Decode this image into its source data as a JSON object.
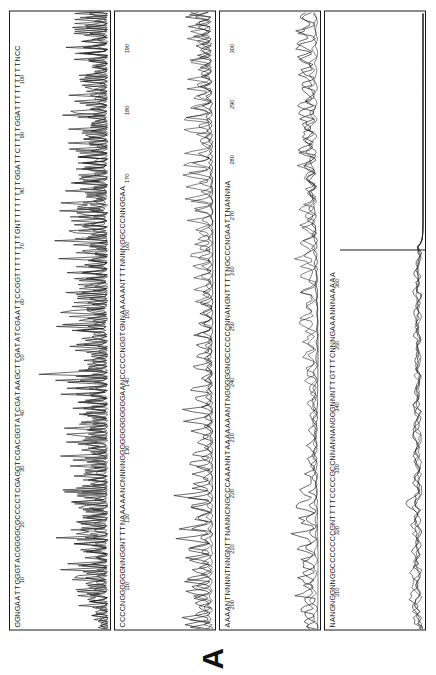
{
  "figure": {
    "panel_label": "A",
    "type": "dna-sequencing-chromatogram",
    "orientation": "rotated-90-ccw",
    "lane_count": 4,
    "ink_color": "#1b1b1b",
    "background_color": "#ffffff"
  },
  "lanes": [
    {
      "id": "lane-1",
      "name": "chromatogram-lane-1",
      "basecalls": "GGNGAATTGGGTACGGGGCGCCCCTCGAGGTCGACGGTATCGATAAGCTTGATATCGAATTCCGGTTTTTTTTGNTTTTTTTTGGATTCTTTTGGATTTTTTTTTNCC",
      "tick_labels": [
        "10",
        "20",
        "30",
        "40",
        "50",
        "60",
        "70",
        "80",
        "90",
        "100"
      ],
      "tick_positions_pct": [
        8.0,
        17.0,
        26.0,
        35.0,
        44.0,
        53.0,
        62.0,
        71.0,
        80.0,
        89.0
      ],
      "signal_quality": "high",
      "description": "sharp well-resolved peaks, tall square-topped early peaks"
    },
    {
      "id": "lane-2",
      "name": "chromatogram-lane-2",
      "basecalls": "CCCCNGGGGGGNNGGNTTTNAAAAANCNNNNGGGGGGGGGGGGAANCCCCCNGGTGNNAAAAANTTTNNNNGGCCCNNGGAA",
      "tick_labels": [
        "110",
        "120",
        "130",
        "140",
        "150",
        "160",
        "170",
        "180",
        "190"
      ],
      "tick_positions_pct": [
        7.0,
        18.0,
        29.0,
        40.0,
        51.0,
        62.0,
        73.0,
        84.0,
        94.0
      ],
      "signal_quality": "medium",
      "description": "broader overlapping peaks with rising baseline"
    },
    {
      "id": "lane-3",
      "name": "chromatogram-lane-3",
      "basecalls": "AAAANTNNNNTNNGNTTNANNCNGCCCAAANNTAAAAAAANTNGGGGGNGCCCCCCNNANGNTTTTNGCCCNGAATTNANNNA",
      "tick_labels": [
        "200",
        "210",
        "220",
        "230",
        "240",
        "250",
        "260",
        "270",
        "280",
        "290",
        "300"
      ],
      "tick_positions_pct": [
        4.0,
        13.0,
        22.0,
        31.0,
        40.0,
        49.0,
        58.0,
        67.0,
        76.0,
        85.0,
        94.0
      ],
      "signal_quality": "low",
      "description": "noisy poorly-resolved peaks, many N calls"
    },
    {
      "id": "lane-4",
      "name": "chromatogram-lane-4",
      "basecalls": "NANGNGGNNGGCCCCCCCGNTTTTCCCCGCCNNANNANGGGNNNTTGTTTCNNNGAAANNNAAAAA",
      "tick_labels": [
        "310",
        "320",
        "330",
        "340",
        "350",
        "360"
      ],
      "tick_positions_pct": [
        6.0,
        16.0,
        26.0,
        36.0,
        46.0,
        56.0
      ],
      "signal_quality": "very-low",
      "description": "flat noisy baseline, signal ends early; right portion blank"
    }
  ],
  "chart_data": {
    "type": "line",
    "title": "A",
    "xlabel": "Base position",
    "ylabel": "Fluorescence intensity",
    "grid": false,
    "legend": "none",
    "series_per_lane": 4,
    "series_names": [
      "A-channel",
      "C-channel",
      "G-channel",
      "T-channel"
    ],
    "x_range_per_lane": [
      [
        1,
        108
      ],
      [
        109,
        190
      ],
      [
        191,
        300
      ],
      [
        301,
        366
      ]
    ],
    "note": "Four stacked electropherogram lanes; peak amplitude decreases and noise increases from lane 1 to lane 4."
  }
}
